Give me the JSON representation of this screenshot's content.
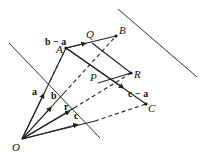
{
  "diagram": {
    "title": "",
    "points": {
      "O": {
        "label": "O",
        "x": 22,
        "y": 139
      },
      "A": {
        "label": "A",
        "x": 66,
        "y": 48
      },
      "B": {
        "label": "B",
        "x": 116,
        "y": 36
      },
      "C": {
        "label": "C",
        "x": 146,
        "y": 104
      },
      "P": {
        "label": "P",
        "x": 98,
        "y": 83
      },
      "Q": {
        "label": "Q",
        "x": 92,
        "y": 43
      },
      "R": {
        "label": "R",
        "x": 131,
        "y": 73
      }
    },
    "vector_labels": {
      "a": "a",
      "b": "b",
      "c": "c",
      "r": "r",
      "b_minus_a": "b − a",
      "c_minus_a": "c − a"
    },
    "lines": [
      {
        "name": "plane-line-left",
        "style": "solid",
        "from": [
          9,
          43
        ],
        "to": [
          100,
          138
        ]
      },
      {
        "name": "plane-line-right",
        "style": "solid",
        "from": [
          118,
          9
        ],
        "to": [
          197,
          77
        ]
      },
      {
        "name": "vector-a",
        "style": "solid",
        "from": "O",
        "to": "A"
      },
      {
        "name": "vector-b",
        "style": "solid-then-dashed",
        "from": "O",
        "to": "B"
      },
      {
        "name": "vector-c",
        "style": "solid-then-dashed",
        "from": "O",
        "to": "C"
      },
      {
        "name": "vector-r",
        "style": "solid-then-dashed",
        "from": "O",
        "to": "R"
      },
      {
        "name": "vector-b-minus-a",
        "style": "solid",
        "from": "A",
        "to": "B"
      },
      {
        "name": "vector-c-minus-a",
        "style": "solid",
        "from": "A",
        "to": "C"
      },
      {
        "name": "segment-QR",
        "style": "solid",
        "from": "Q",
        "to": "R"
      },
      {
        "name": "segment-PR",
        "style": "solid",
        "from": "P",
        "to": "R"
      }
    ]
  }
}
